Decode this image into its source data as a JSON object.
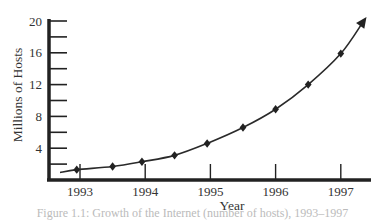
{
  "chart_data": {
    "type": "line",
    "title": "",
    "xlabel": "Year",
    "ylabel": "Millions of Hosts",
    "x_ticks": [
      "1993",
      "1994",
      "1995",
      "1996",
      "1997"
    ],
    "y_ticks": [
      "4",
      "8",
      "12",
      "16",
      "20"
    ],
    "y_minor_ticks": [
      2,
      6,
      10,
      14,
      18
    ],
    "ylim": [
      0,
      20
    ],
    "xlim": [
      1992.4,
      1997.55
    ],
    "grid": false,
    "legend": null,
    "series": [
      {
        "name": "Internet hosts",
        "marker": "diamond",
        "end_arrow": true,
        "x": [
          1992.95,
          1993.5,
          1993.95,
          1994.45,
          1994.95,
          1995.5,
          1996.0,
          1996.5,
          1997.0,
          1997.35
        ],
        "y": [
          1.3,
          1.7,
          2.3,
          3.1,
          4.6,
          6.6,
          8.9,
          12.0,
          15.9,
          20.0
        ]
      }
    ],
    "annotations": []
  },
  "caption": {
    "text": "Figure 1.1: Growth of the Internet (number of hosts), 1993–1997"
  }
}
